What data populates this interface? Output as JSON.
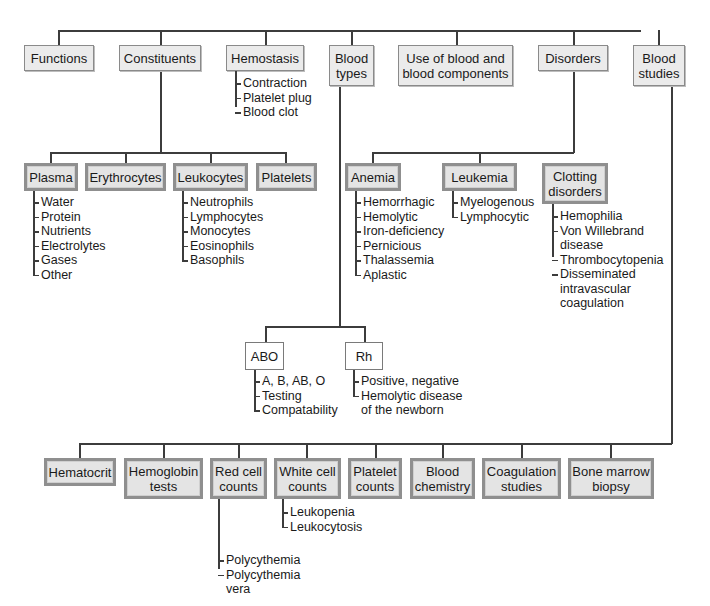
{
  "top_level": [
    {
      "id": "functions",
      "label": "Functions"
    },
    {
      "id": "constituents",
      "label": "Constituents"
    },
    {
      "id": "hemostasis",
      "label": "Hemostasis"
    },
    {
      "id": "blood_types",
      "label": "Blood\ntypes"
    },
    {
      "id": "use",
      "label": "Use of blood and\nblood components"
    },
    {
      "id": "disorders",
      "label": "Disorders"
    },
    {
      "id": "blood_studies",
      "label": "Blood\nstudies"
    }
  ],
  "hemostasis_items": [
    "Contraction",
    "Platelet plug",
    "Blood clot"
  ],
  "constituents": [
    {
      "id": "plasma",
      "label": "Plasma",
      "items": [
        "Water",
        "Protein",
        "Nutrients",
        "Electrolytes",
        "Gases",
        "Other"
      ]
    },
    {
      "id": "erythrocytes",
      "label": "Erythrocytes",
      "items": []
    },
    {
      "id": "leukocytes",
      "label": "Leukocytes",
      "items": [
        "Neutrophils",
        "Lymphocytes",
        "Monocytes",
        "Eosinophils",
        "Basophils"
      ]
    },
    {
      "id": "platelets",
      "label": "Platelets",
      "items": []
    }
  ],
  "disorders": [
    {
      "id": "anemia",
      "label": "Anemia",
      "items": [
        "Hemorrhagic",
        "Hemolytic",
        "Iron-deficiency",
        "Pernicious",
        "Thalassemia",
        "Aplastic"
      ]
    },
    {
      "id": "leukemia",
      "label": "Leukemia",
      "items": [
        "Myelogenous",
        "Lymphocytic"
      ]
    },
    {
      "id": "clotting",
      "label": "Clotting\ndisorders",
      "items": [
        "Hemophilia",
        "Von Willebrand\n   disease",
        "Thrombocytopenia",
        "Disseminated\n   intravascular\n   coagulation"
      ]
    }
  ],
  "blood_types": [
    {
      "id": "abo",
      "label": "ABO",
      "items": [
        "A, B, AB, O",
        "Testing",
        "Compatability"
      ]
    },
    {
      "id": "rh",
      "label": "Rh",
      "items": [
        "Positive, negative",
        "Hemolytic disease\n   of the newborn"
      ]
    }
  ],
  "blood_studies": [
    {
      "id": "hematocrit",
      "label": "Hematocrit",
      "items": []
    },
    {
      "id": "hemoglobin",
      "label": "Hemoglobin\ntests",
      "items": []
    },
    {
      "id": "red_cell",
      "label": "Red cell\ncounts",
      "items": [
        "Polycythemia",
        "Polycythemia\n   vera"
      ]
    },
    {
      "id": "white_cell",
      "label": "White cell\ncounts",
      "items": [
        "Leukopenia",
        "Leukocytosis"
      ]
    },
    {
      "id": "platelet_counts",
      "label": "Platelet\ncounts",
      "items": []
    },
    {
      "id": "chemistry",
      "label": "Blood\nchemistry",
      "items": []
    },
    {
      "id": "coagulation",
      "label": "Coagulation\nstudies",
      "items": []
    },
    {
      "id": "bone_marrow",
      "label": "Bone marrow\nbiopsy",
      "items": []
    }
  ],
  "colors": {
    "box_fill": "#e6e6e6",
    "box_border": "#8f8f8f",
    "line": "#3c3c3c",
    "text": "#1a1a1a"
  }
}
